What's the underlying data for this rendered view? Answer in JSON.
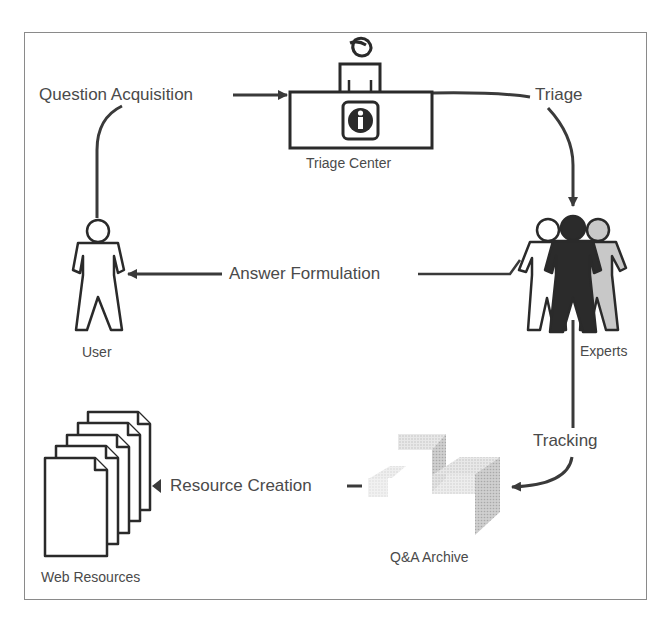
{
  "diagram": {
    "type": "process-cycle",
    "nodes": {
      "triage_center": {
        "label": "Triage Center",
        "icon": "info-desk-icon"
      },
      "experts": {
        "label": "Experts",
        "icon": "expert-group-icon"
      },
      "user": {
        "label": "User",
        "icon": "user-icon"
      },
      "qa_archive": {
        "label": "Q&A Archive",
        "icon": "archive-cubes-icon"
      },
      "web_resources": {
        "label": "Web Resources",
        "icon": "document-stack-icon"
      }
    },
    "edges": {
      "question_acquisition": {
        "label": "Question Acquisition",
        "from": "User",
        "to": "Triage Center"
      },
      "triage": {
        "label": "Triage",
        "from": "Triage Center",
        "to": "Experts"
      },
      "answer_formulation": {
        "label": "Answer Formulation",
        "from": "Experts",
        "to": "User"
      },
      "tracking": {
        "label": "Tracking",
        "from": "Experts",
        "to": "Q&A Archive"
      },
      "resource_creation": {
        "label": "Resource Creation",
        "from": "Q&A Archive",
        "to": "Web Resources"
      }
    },
    "colors": {
      "line": "#3a3a3a",
      "text": "#4a4a4a",
      "frame": "#8a8a8a",
      "expert_dark": "#2b2b2b",
      "expert_light": "#c8c8c8",
      "archive_gray": "#cfcfcf"
    }
  }
}
